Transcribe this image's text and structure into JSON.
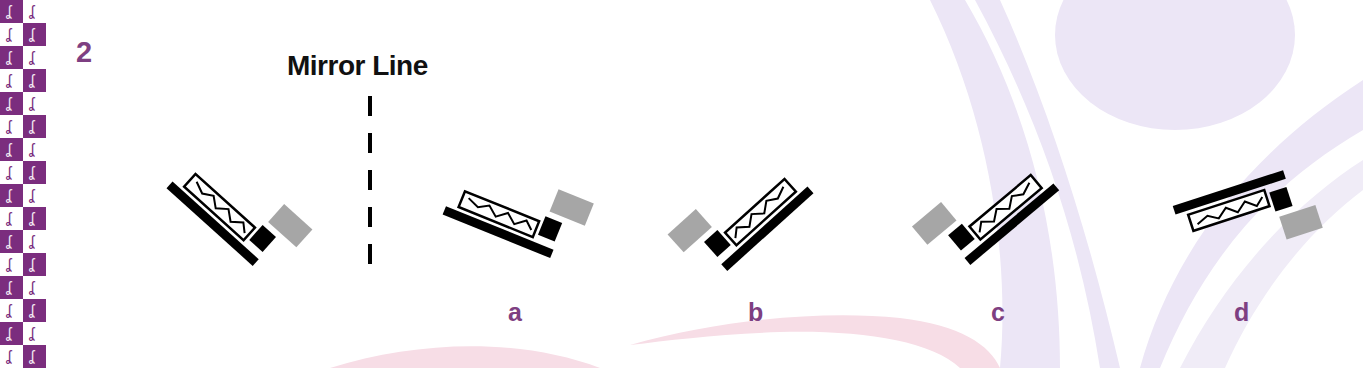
{
  "question": {
    "number": "2",
    "title": "Mirror Line"
  },
  "colors": {
    "accent_purple": "#7e3f82",
    "strip_purple": "#7b2d7e",
    "shape_black": "#000000",
    "shape_gray": "#a6a6a6",
    "bg_lavender": "#ece6f6",
    "bg_pink": "#f7dde6"
  },
  "left_strip": {
    "pattern": "checkerboard",
    "icon": "dancer-figure-icon",
    "glyph": "ʆ"
  },
  "figures": {
    "original": {
      "name": "original-shape",
      "rotation": 42
    },
    "mirror_line": {
      "style": "dashed",
      "dashes": 5
    },
    "options": [
      {
        "label": "a",
        "rotation": 22
      },
      {
        "label": "b",
        "rotation": -48
      },
      {
        "label": "c",
        "rotation": -48
      },
      {
        "label": "d",
        "rotation": -18
      }
    ]
  }
}
